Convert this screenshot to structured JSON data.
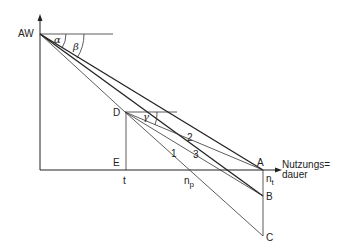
{
  "diagram": {
    "axis_y_label": "AW",
    "axis_x_label_line1": "Nutzungs=",
    "axis_x_label_line2": "dauer",
    "points": {
      "D": "D",
      "E": "E",
      "A": "A",
      "B": "B",
      "C": "C"
    },
    "ticks": {
      "t": "t",
      "np_main": "n",
      "np_sub": "p",
      "nt_main": "n",
      "nt_sub": "t"
    },
    "angles": {
      "alpha": "α",
      "beta": "β",
      "gamma": "γ"
    },
    "line_labels": {
      "l1": "1",
      "l2": "2",
      "l3": "3"
    }
  }
}
